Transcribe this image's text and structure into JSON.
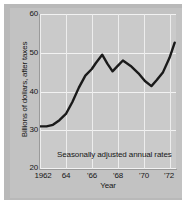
{
  "chart_data": {
    "type": "line",
    "title": "",
    "subtitle": "",
    "xlabel": "Year",
    "ylabel": "Billions of dollars, after taxes",
    "annotation": "Seasonally adjusted annual rates",
    "grid": true,
    "legend_position": "none",
    "xlim": [
      1962,
      1972.5
    ],
    "ylim": [
      20,
      60
    ],
    "xticks": [
      1962,
      1964,
      1966,
      1968,
      1970,
      1972
    ],
    "xticklabels": [
      "1962",
      "64",
      "'66",
      "'68",
      "'70",
      "'72"
    ],
    "yticks": [
      20,
      30,
      40,
      50,
      60
    ],
    "yticklabels": [
      "20",
      "30",
      "40",
      "50",
      "60"
    ],
    "series": [
      {
        "name": "Corporate profits after taxes",
        "x": [
          1962.0,
          1962.5,
          1963.0,
          1963.5,
          1964.0,
          1964.5,
          1965.0,
          1965.5,
          1966.0,
          1966.3,
          1966.8,
          1967.2,
          1967.6,
          1968.0,
          1968.4,
          1969.0,
          1969.6,
          1970.1,
          1970.6,
          1971.0,
          1971.5,
          1972.0,
          1972.4
        ],
        "y": [
          31.0,
          31.0,
          31.4,
          32.6,
          34.2,
          37.3,
          41.0,
          44.1,
          45.8,
          47.3,
          49.5,
          47.2,
          45.2,
          46.6,
          48.0,
          46.6,
          44.7,
          42.7,
          41.4,
          42.9,
          45.0,
          48.7,
          52.6
        ]
      }
    ],
    "line_color": "#1a1a1a",
    "line_width": 2.4,
    "plot_background": "#cacaca",
    "panel_background": "#c2c2c2",
    "gridline_color": "#f2f2f2"
  },
  "axes": {
    "x_title": "Year",
    "y_title": "Billions of dollars, after taxes"
  }
}
